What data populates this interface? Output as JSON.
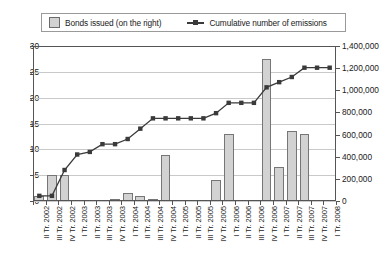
{
  "legend": {
    "bars_label": "Bonds issued (on the right)",
    "line_label": "Cumulative number of emissions",
    "bars_swatch_icon": "bar-swatch-icon",
    "line_marker_icon": "line-marker-icon"
  },
  "axis": {
    "left_ticks": [
      "30",
      "25",
      "20",
      "15",
      "10",
      "5",
      "0"
    ],
    "right_ticks": [
      "1,400,000",
      "1,200,000",
      "1,000,000",
      "800,000",
      "600,000",
      "400,000",
      "200,000",
      "0"
    ]
  },
  "chart_data": {
    "type": "bar",
    "title": "",
    "subtitle": "",
    "xlabel": "",
    "ylabel": "",
    "y2label": "",
    "ylim": [
      0,
      30
    ],
    "y2lim": [
      0,
      1400000
    ],
    "grid": true,
    "legend_position": "top",
    "categories": [
      "II Tr. 2002",
      "III Tr. 2002",
      "IV Tr. 2002",
      "I Tr. 2003",
      "II Tr. 2003",
      "III Tr. 2003",
      "IV Tr. 2003",
      "I Tr. 2004",
      "II Tr. 2004",
      "III Tr. 2004",
      "IV Tr. 2004",
      "I Tr. 2005",
      "II Tr. 2005",
      "III Tr. 2005",
      "IV Tr. 2005",
      "I Tr. 2006",
      "II Tr. 2006",
      "III Tr. 2006",
      "IV Tr. 2006",
      "I Tr. 2007",
      "II Tr. 2007",
      "III Tr. 2007",
      "IV Tr. 2007",
      "I Tr. 2008"
    ],
    "series": [
      {
        "name": "Bonds issued (on the right)",
        "type": "bar",
        "axis": "right",
        "values": [
          1,
          5,
          5,
          0,
          0,
          0,
          0.3,
          1.5,
          1,
          0.3,
          9,
          0,
          0,
          0,
          4,
          13,
          0,
          0,
          27.5,
          6.5,
          13.5,
          13,
          0,
          0
        ]
      },
      {
        "name": "Cumulative number of emissions",
        "type": "line",
        "axis": "left",
        "values": [
          1,
          1,
          6,
          9,
          9.5,
          11,
          11,
          12,
          14,
          16,
          16,
          16,
          16,
          16,
          17,
          19,
          19,
          19,
          22,
          23,
          24,
          25.8,
          25.8,
          25.8
        ]
      }
    ]
  }
}
